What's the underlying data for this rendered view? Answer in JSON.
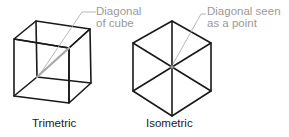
{
  "figure": {
    "colors": {
      "edge": "#1a1a1a",
      "leader": "#a8a8a8",
      "callout_text": "#9a9a9a",
      "caption_text": "#1a1a1a",
      "background": "#ffffff"
    },
    "trimetric": {
      "caption": "Trimetric",
      "callout_line1": "Diagonal",
      "callout_line2": "of cube",
      "icon": "cube-wireframe-icon"
    },
    "isometric": {
      "caption": "Isometric",
      "callout_line1": "Diagonal seen",
      "callout_line2": "as a point",
      "icon": "hexagon-cube-icon"
    }
  }
}
